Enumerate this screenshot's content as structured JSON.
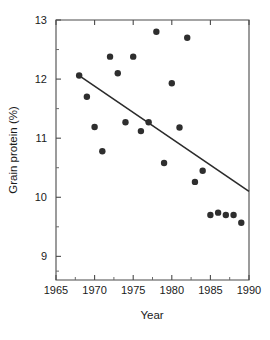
{
  "chart_data": {
    "type": "scatter",
    "title": "",
    "xlabel": "Year",
    "ylabel": "Grain protein (%)",
    "xlim": [
      1965,
      1990
    ],
    "ylim": [
      8.6,
      13.0
    ],
    "grid": false,
    "legend": "none",
    "x_ticks": [
      1965,
      1970,
      1975,
      1980,
      1985,
      1990
    ],
    "x_tick_labels": [
      "1965",
      "1970",
      "1975",
      "1980",
      "1985",
      "1990"
    ],
    "x_minor_ticks": [
      1967.5,
      1972.5,
      1977.5,
      1982.5,
      1987.5
    ],
    "y_ticks": [
      9,
      10,
      11,
      12,
      13
    ],
    "y_tick_labels": [
      "9",
      "10",
      "11",
      "12",
      "13"
    ],
    "y_minor_ticks": [
      8.75,
      9.5,
      10.5,
      11.5,
      12.5
    ],
    "marker": "filled-circle",
    "marker_color": "#2e2e2e",
    "marker_size_px": 6.4,
    "x": [
      1968,
      1969,
      1970,
      1971,
      1972,
      1973,
      1974,
      1975,
      1976,
      1977,
      1978,
      1979,
      1980,
      1981,
      1982,
      1983,
      1984,
      1985,
      1986,
      1987,
      1988,
      1989
    ],
    "y": [
      12.06,
      11.7,
      11.19,
      10.78,
      12.38,
      12.1,
      11.27,
      12.38,
      11.12,
      11.27,
      12.8,
      10.58,
      11.93,
      11.18,
      12.7,
      10.26,
      10.45,
      9.7,
      9.74,
      9.7,
      9.7,
      9.57
    ],
    "series": [
      {
        "name": "Grain protein",
        "points": [
          {
            "x": 1968,
            "y": 12.06
          },
          {
            "x": 1969,
            "y": 11.7
          },
          {
            "x": 1970,
            "y": 11.19
          },
          {
            "x": 1971,
            "y": 10.78
          },
          {
            "x": 1972,
            "y": 12.38
          },
          {
            "x": 1973,
            "y": 12.1
          },
          {
            "x": 1974,
            "y": 11.27
          },
          {
            "x": 1975,
            "y": 12.38
          },
          {
            "x": 1976,
            "y": 11.12
          },
          {
            "x": 1977,
            "y": 11.27
          },
          {
            "x": 1978,
            "y": 12.8
          },
          {
            "x": 1979,
            "y": 10.58
          },
          {
            "x": 1980,
            "y": 11.93
          },
          {
            "x": 1981,
            "y": 11.18
          },
          {
            "x": 1982,
            "y": 12.7
          },
          {
            "x": 1983,
            "y": 10.26
          },
          {
            "x": 1984,
            "y": 10.45
          },
          {
            "x": 1985,
            "y": 9.7
          },
          {
            "x": 1986,
            "y": 9.74
          },
          {
            "x": 1987,
            "y": 9.7
          },
          {
            "x": 1988,
            "y": 9.7
          },
          {
            "x": 1989,
            "y": 9.57
          }
        ]
      }
    ],
    "trend_line": {
      "name": "regression-line",
      "color": "#2b2b2b",
      "x_start": 1968,
      "y_start": 12.06,
      "x_end": 1990,
      "y_end": 10.1
    }
  }
}
